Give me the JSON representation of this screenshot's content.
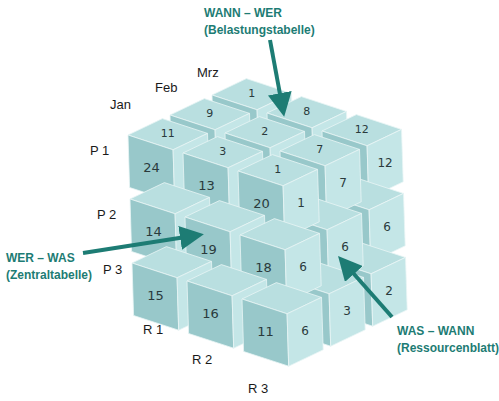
{
  "callouts": {
    "top": {
      "title": "WANN – WER",
      "subtitle": "(Belastungstabelle)"
    },
    "left": {
      "title": "WER – WAS",
      "subtitle": "(Zentraltabelle)"
    },
    "right": {
      "title": "WAS – WANN",
      "subtitle": "(Ressourcenblatt)"
    }
  },
  "axis_labels": {
    "months": [
      "Jan",
      "Feb",
      "Mrz"
    ],
    "persons": [
      "P 1",
      "P 2",
      "P 3"
    ],
    "resources": [
      "R 1",
      "R 2",
      "R 3"
    ]
  },
  "cube_values": {
    "top_face": {
      "row_back": [
        "1",
        "8",
        "12"
      ],
      "row_mid": [
        "9",
        "2",
        "7"
      ],
      "row_front": [
        "11",
        "3",
        "1"
      ]
    },
    "front_face": {
      "row_p1": [
        "24",
        "13",
        "20"
      ],
      "row_p2": [
        "14",
        "19",
        "18"
      ],
      "row_p3": [
        "15",
        "16",
        "11"
      ]
    },
    "right_face": {
      "row_top": [
        "1",
        "7",
        "12"
      ],
      "row_mid": [
        "6",
        "6",
        "6"
      ],
      "row_bottom": [
        "6",
        "3",
        "2"
      ]
    }
  },
  "colors": {
    "cube_top": "#b9dfe0",
    "cube_front": "#98c8ca",
    "cube_right": "#c4e6e7",
    "arrow": "#1d7c74"
  }
}
